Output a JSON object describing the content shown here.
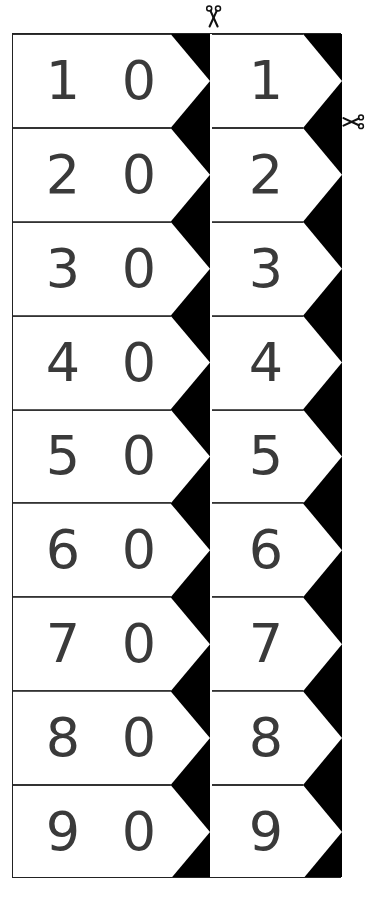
{
  "document": {
    "title": "Number Arrow Cut-Out Strips",
    "background_color": "#ffffff",
    "ink_color": "#3a3a3a",
    "arrow_fill_color": "#ffffff",
    "column_background_color": "#000000",
    "frame_border_color": "#222222"
  },
  "cut_markers": [
    {
      "name": "scissors-top",
      "icon": "scissors-icon",
      "glyph": "✂",
      "orientation": "vertical",
      "position": "top-center-between-columns"
    },
    {
      "name": "scissors-right",
      "icon": "scissors-icon",
      "glyph": "✂",
      "orientation": "horizontal",
      "position": "right-edge"
    }
  ],
  "columns": [
    {
      "name": "tens-strip",
      "digits_per_card": 2,
      "cards": [
        {
          "primary": "1",
          "zero": "0",
          "value": "10"
        },
        {
          "primary": "2",
          "zero": "0",
          "value": "20"
        },
        {
          "primary": "3",
          "zero": "0",
          "value": "30"
        },
        {
          "primary": "4",
          "zero": "0",
          "value": "40"
        },
        {
          "primary": "5",
          "zero": "0",
          "value": "50"
        },
        {
          "primary": "6",
          "zero": "0",
          "value": "60"
        },
        {
          "primary": "7",
          "zero": "0",
          "value": "70"
        },
        {
          "primary": "8",
          "zero": "0",
          "value": "80"
        },
        {
          "primary": "9",
          "zero": "0",
          "value": "90"
        }
      ]
    },
    {
      "name": "ones-strip",
      "digits_per_card": 1,
      "cards": [
        {
          "primary": "1",
          "value": "1"
        },
        {
          "primary": "2",
          "value": "2"
        },
        {
          "primary": "3",
          "value": "3"
        },
        {
          "primary": "4",
          "value": "4"
        },
        {
          "primary": "5",
          "value": "5"
        },
        {
          "primary": "6",
          "value": "6"
        },
        {
          "primary": "7",
          "value": "7"
        },
        {
          "primary": "8",
          "value": "8"
        },
        {
          "primary": "9",
          "value": "9"
        }
      ]
    }
  ]
}
